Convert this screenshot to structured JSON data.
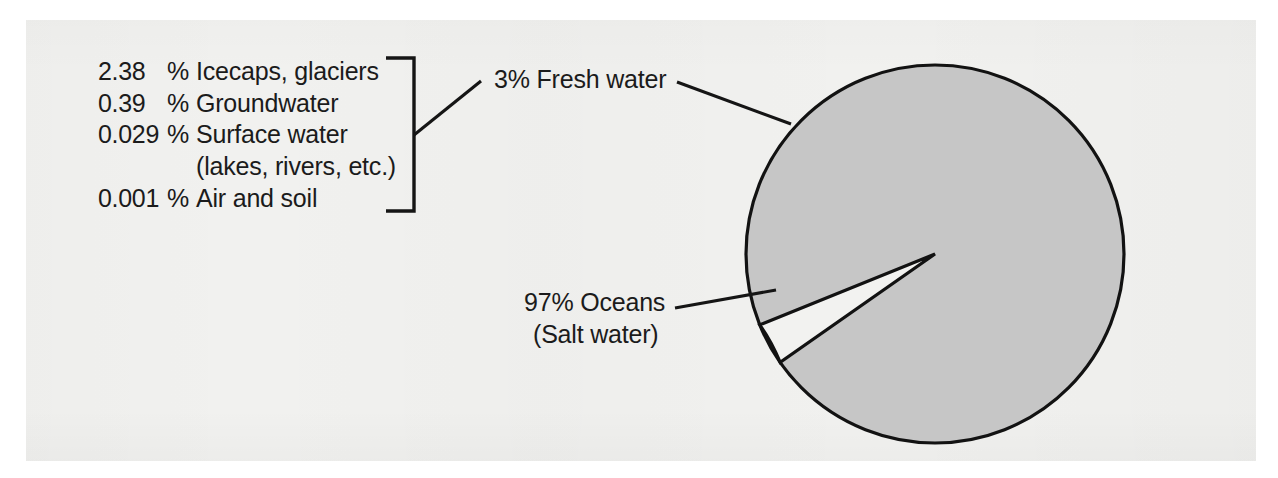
{
  "figure": {
    "background_color": "#f1f1ef",
    "ink_color": "#1b1b1b"
  },
  "legend": {
    "rows": [
      {
        "percent": "2.38",
        "percent_symbol": "%",
        "label": "Icecaps, glaciers"
      },
      {
        "percent": "0.39",
        "percent_symbol": "%",
        "label": "Groundwater"
      },
      {
        "percent": "0.029",
        "percent_symbol": "%",
        "label": "Surface water"
      },
      {
        "percent": "",
        "percent_symbol": "",
        "label": "(lakes, rivers, etc.)"
      },
      {
        "percent": "0.001",
        "percent_symbol": "%",
        "label": "Air and soil"
      }
    ]
  },
  "callouts": {
    "fresh_water": "3% Fresh water",
    "oceans_line1": "97% Oceans",
    "oceans_line2": "(Salt water)"
  },
  "chart_data": {
    "type": "pie",
    "categories": [
      "Oceans (Salt water)",
      "Fresh water"
    ],
    "values": [
      97,
      3
    ],
    "unit": "%",
    "slice_colors": [
      "#c6c6c6",
      "#f2f2f0"
    ],
    "outline_color": "#121212",
    "legend_position": "left-callouts",
    "grid": false,
    "annotations": [
      "3% Fresh water",
      "97% Oceans (Salt water)"
    ],
    "breakdown": {
      "parent": "Fresh water",
      "parent_value": 3,
      "items": [
        {
          "label": "Icecaps, glaciers",
          "value": 2.38
        },
        {
          "label": "Groundwater",
          "value": 0.39
        },
        {
          "label": "Surface water (lakes, rivers, etc.)",
          "value": 0.029
        },
        {
          "label": "Air and soil",
          "value": 0.001
        }
      ]
    },
    "geometry": {
      "center_x": 935,
      "center_y": 254,
      "radius": 189,
      "fresh_water_start_deg": 202,
      "fresh_water_end_deg": 215
    }
  }
}
